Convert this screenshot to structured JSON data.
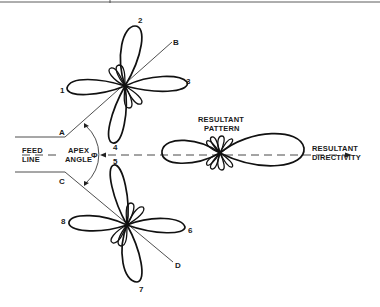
{
  "figure": {
    "type": "rhombic antenna radiation pattern diagram",
    "labels": {
      "feed_line_1": "FEED",
      "feed_line_2": "LINE",
      "apex_angle_1": "APEX",
      "apex_angle_2": "ANGLE",
      "phi": "Φ",
      "resultant_pattern_1": "RESULTANT",
      "resultant_pattern_2": "PATTERN",
      "resultant_directivity_1": "RESULTANT",
      "resultant_directivity_2": "DIRECTIVITY"
    },
    "corners": {
      "a": "A",
      "b": "B",
      "c": "C",
      "d": "D"
    },
    "lobes": {
      "l1": "1",
      "l2": "2",
      "l3": "3",
      "l4": "4",
      "l5": "5",
      "l6": "6",
      "l7": "7",
      "l8": "8"
    },
    "colors": {
      "ink": "#111111",
      "background": "#ffffff"
    }
  }
}
